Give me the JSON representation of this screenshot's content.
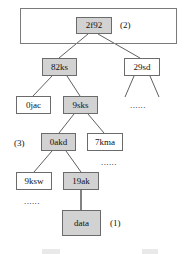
{
  "figure": {
    "type": "merkle-tree-diagram",
    "background": "#ffffff",
    "node_fill_shaded": "#d2d2d2",
    "node_fill_plain": "#ffffff",
    "border_color": "#6b6b6b"
  },
  "group_box": {
    "name": "root-group-box"
  },
  "nodes": [
    {
      "id": "root",
      "label": "2f92",
      "shaded": true,
      "x": 76,
      "y": 17,
      "w": 36,
      "h": 17
    },
    {
      "id": "n82ks",
      "label": "82ks",
      "shaded": true,
      "x": 42,
      "y": 58,
      "w": 35,
      "h": 18
    },
    {
      "id": "n29sd",
      "label": "29sd",
      "shaded": false,
      "x": 124,
      "y": 58,
      "w": 36,
      "h": 18
    },
    {
      "id": "n0jac",
      "label": "0jac",
      "shaded": false,
      "x": 16,
      "y": 96,
      "w": 35,
      "h": 18
    },
    {
      "id": "n9sks",
      "label": "9sks",
      "shaded": true,
      "x": 63,
      "y": 96,
      "w": 35,
      "h": 18
    },
    {
      "id": "n0akd",
      "label": "0akd",
      "shaded": true,
      "x": 41,
      "y": 133,
      "w": 35,
      "h": 18
    },
    {
      "id": "n7kma",
      "label": "7kma",
      "shaded": false,
      "x": 87,
      "y": 133,
      "w": 36,
      "h": 18
    },
    {
      "id": "n9ksw",
      "label": "9ksw",
      "shaded": false,
      "x": 16,
      "y": 172,
      "w": 36,
      "h": 18
    },
    {
      "id": "n19ak",
      "label": "19ak",
      "shaded": true,
      "x": 63,
      "y": 172,
      "w": 36,
      "h": 18
    },
    {
      "id": "ndata",
      "label": "data",
      "shaded": true,
      "x": 62,
      "y": 210,
      "w": 39,
      "h": 26
    }
  ],
  "tags": [
    {
      "id": "tag-2",
      "label": "(2)",
      "x": 120,
      "y": 21
    },
    {
      "id": "tag-3",
      "label": "(3)",
      "x": 14,
      "y": 139
    },
    {
      "id": "tag-1",
      "label": "(1)",
      "x": 110,
      "y": 219
    }
  ],
  "ellipses": [
    {
      "id": "dots-under-29sd",
      "label": "......",
      "x": 130,
      "y": 101
    },
    {
      "id": "dots-under-7kma",
      "label": "......",
      "x": 101,
      "y": 158
    },
    {
      "id": "dots-under-9ksw",
      "label": "......",
      "x": 24,
      "y": 197
    }
  ],
  "edges": [
    {
      "from": "root",
      "to": "n82ks"
    },
    {
      "from": "root",
      "to": "n29sd"
    },
    {
      "from": "n82ks",
      "to": "n0jac"
    },
    {
      "from": "n82ks",
      "to": "n9sks"
    },
    {
      "from": "n29sd",
      "to": "child-left-stub"
    },
    {
      "from": "n29sd",
      "to": "child-right-stub"
    },
    {
      "from": "n9sks",
      "to": "n0akd"
    },
    {
      "from": "n9sks",
      "to": "n7kma"
    },
    {
      "from": "n0akd",
      "to": "n9ksw"
    },
    {
      "from": "n0akd",
      "to": "n19ak"
    },
    {
      "from": "n19ak",
      "to": "ndata"
    }
  ]
}
